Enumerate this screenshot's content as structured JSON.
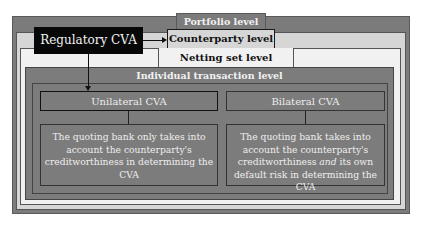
{
  "diagram": {
    "regulatory_cva": "Regulatory CVA",
    "levels": {
      "portfolio": "Portfolio level",
      "counterparty": "Counterparty level",
      "netting_set": "Netting set level",
      "individual_transaction": "Individual transaction level"
    },
    "unilateral": {
      "title": "Unilateral CVA",
      "description": "The quoting bank only takes into account the counterparty's creditworthiness in determining the CVA"
    },
    "bilateral": {
      "title": "Bilateral CVA",
      "description_part1": "The quoting bank takes into account the counterparty's creditworthiness",
      "description_emphasis": "and",
      "description_part2": "its own default risk in determining the CVA"
    },
    "colors": {
      "portfolio_fill": "#7b7b7b",
      "counterparty_fill": "#d6d6d6",
      "netting_fill": "#f1f1f1",
      "transaction_fill": "#7c7c7c",
      "regulatory_fill": "#080808"
    }
  }
}
